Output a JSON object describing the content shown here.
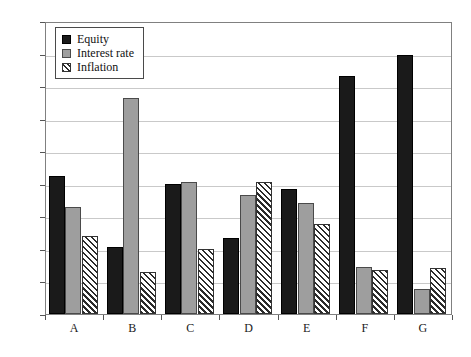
{
  "chart_data": {
    "type": "bar",
    "title": "",
    "xlabel": "",
    "ylabel": "",
    "categories": [
      "A",
      "B",
      "C",
      "D",
      "E",
      "F",
      "G"
    ],
    "ylim": [
      0,
      90
    ],
    "ytick_labels": [
      "0%",
      "10%",
      "20%",
      "30%",
      "40%",
      "50%",
      "60%",
      "70%",
      "80%",
      "90%"
    ],
    "ytick_values": [
      0,
      10,
      20,
      30,
      40,
      50,
      60,
      70,
      80,
      90
    ],
    "grid": true,
    "legend_position": "top-left",
    "series": [
      {
        "name": "Equity",
        "color": "#1a1a1a",
        "fill": "solid-black",
        "values": [
          42.5,
          20.5,
          40.0,
          23.5,
          38.3,
          73.0,
          79.5
        ]
      },
      {
        "name": "Interest rate",
        "color": "#9e9e9e",
        "fill": "solid-gray",
        "values": [
          33.0,
          66.5,
          40.5,
          36.5,
          34.0,
          14.5,
          7.8
        ]
      },
      {
        "name": "Inflation",
        "color": "#2b2b2b",
        "fill": "diagonal-hatch",
        "values": [
          24.0,
          12.8,
          20.0,
          40.5,
          27.5,
          13.5,
          14.0
        ]
      }
    ]
  }
}
